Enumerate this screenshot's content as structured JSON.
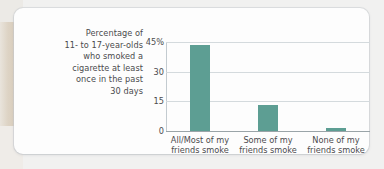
{
  "caption": {
    "lines": [
      "Percentage of",
      "11- to 17-year-olds",
      "who smoked a",
      "cigarette at least",
      "once in the past",
      "30 days"
    ],
    "full_text": "Percentage of 11- to 17-year-olds who smoked a cigarette at least once in the past 30 days"
  },
  "colors": {
    "bar": "#5d9e93",
    "gridline": "#d4dadd",
    "axis": "#9aa4a8",
    "text": "#4b4b4d",
    "card_background": "#fdfdfd",
    "page_background": "#f1f1f0",
    "left_strip": "#d9cdbc"
  },
  "chart_data": {
    "type": "bar",
    "title": "",
    "subtitle": "",
    "xlabel": "",
    "ylabel": "Percentage of 11- to 17-year-olds who smoked a cigarette at least once in the past 30 days",
    "categories": [
      "All/Most of my friends smoke",
      "Some of my friends smoke",
      "None of my friends smoke"
    ],
    "category_lines": [
      [
        "All/Most of my",
        "friends smoke"
      ],
      [
        "Some of my",
        "friends smoke"
      ],
      [
        "None of my",
        "friends smoke"
      ]
    ],
    "values": [
      43.5,
      13,
      1.5
    ],
    "ylim": [
      0,
      45
    ],
    "yticks": [
      0,
      15,
      30,
      45
    ],
    "ytick_labels": [
      "0",
      "15",
      "30",
      "45%"
    ],
    "grid": true,
    "legend": false,
    "legend_position": "none",
    "bar_color": "#5d9e93"
  }
}
